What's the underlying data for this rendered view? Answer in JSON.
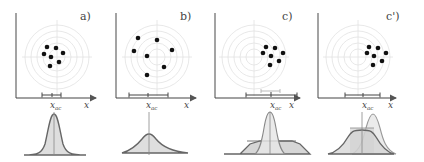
{
  "panels": [
    {
      "label": "a)",
      "axis_x_label": "x",
      "mean_label": "x",
      "mean_sub": "ac"
    },
    {
      "label": "b)",
      "axis_x_label": "x",
      "mean_label": "x",
      "mean_sub": "ac"
    },
    {
      "label": "c)",
      "axis_x_label": "x",
      "mean_label": "x",
      "mean_sub": "ac"
    },
    {
      "label": "c')",
      "axis_x_label": "x",
      "mean_label": "x",
      "mean_sub": "ac"
    }
  ],
  "colors": {
    "axis": "#555555",
    "rings": "#dddddd",
    "dots": "#111111",
    "curve": "#666666",
    "fill": "#d9d9d9"
  }
}
